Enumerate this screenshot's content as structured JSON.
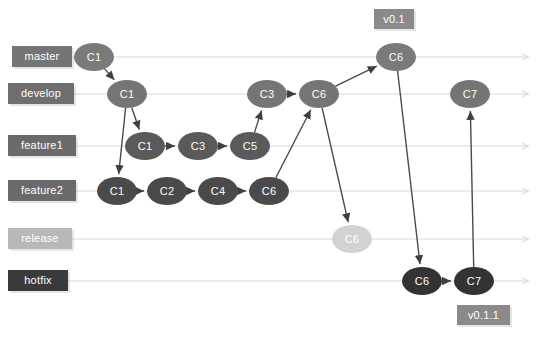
{
  "diagram": {
    "width": 537,
    "height": 339,
    "background": "#ffffff"
  },
  "colors": {
    "master_label": "#757575",
    "develop_label": "#6e6e6e",
    "feature1_label": "#6a6a6a",
    "feature2_label": "#6a6a6a",
    "release_label": "#b8b8b8",
    "hotfix_label": "#3a3a3a",
    "tag": "#8a8a8a",
    "node_master": "#7a7a7a",
    "node_develop": "#757575",
    "node_feature1": "#5a5a5a",
    "node_feature2": "#4a4a4a",
    "node_release": "#d2d2d2",
    "node_hotfix": "#333333",
    "lane_line": "#e6e6e6",
    "edge_line": "#4a4a4a"
  },
  "lanes": [
    {
      "id": "master",
      "label": "master",
      "y": 57,
      "label_x": 12,
      "label_w": 60,
      "color": "#757575",
      "line_x1": 70,
      "line_x2": 528
    },
    {
      "id": "develop",
      "label": "develop",
      "y": 94,
      "label_x": 8,
      "label_w": 66,
      "color": "#6e6e6e",
      "line_x1": 72,
      "line_x2": 528
    },
    {
      "id": "feature1",
      "label": "feature1",
      "y": 146,
      "label_x": 8,
      "label_w": 68,
      "color": "#6a6a6a",
      "line_x1": 74,
      "line_x2": 528
    },
    {
      "id": "feature2",
      "label": "feature2",
      "y": 191,
      "label_x": 8,
      "label_w": 68,
      "color": "#6a6a6a",
      "line_x1": 74,
      "line_x2": 528
    },
    {
      "id": "release",
      "label": "release",
      "y": 239,
      "label_x": 8,
      "label_w": 64,
      "color": "#b8b8b8",
      "line_x1": 72,
      "line_x2": 528
    },
    {
      "id": "hotfix",
      "label": "hotfix",
      "y": 281,
      "label_x": 8,
      "label_w": 60,
      "color": "#3a3a3a",
      "line_x1": 68,
      "line_x2": 528
    }
  ],
  "commits": [
    {
      "id": "m-c1",
      "label": "C1",
      "lane": "master",
      "x": 94,
      "y": 57,
      "color": "#7a7a7a"
    },
    {
      "id": "m-c6",
      "label": "C6",
      "lane": "master",
      "x": 396,
      "y": 57,
      "color": "#7a7a7a"
    },
    {
      "id": "d-c1",
      "label": "C1",
      "lane": "develop",
      "x": 127,
      "y": 94,
      "color": "#757575"
    },
    {
      "id": "d-c3",
      "label": "C3",
      "lane": "develop",
      "x": 267,
      "y": 94,
      "color": "#757575"
    },
    {
      "id": "d-c6",
      "label": "C6",
      "lane": "develop",
      "x": 319,
      "y": 94,
      "color": "#757575"
    },
    {
      "id": "d-c7",
      "label": "C7",
      "lane": "develop",
      "x": 470,
      "y": 94,
      "color": "#757575"
    },
    {
      "id": "f1-c1",
      "label": "C1",
      "lane": "feature1",
      "x": 145,
      "y": 146,
      "color": "#5a5a5a"
    },
    {
      "id": "f1-c3",
      "label": "C3",
      "lane": "feature1",
      "x": 198,
      "y": 146,
      "color": "#5a5a5a"
    },
    {
      "id": "f1-c5",
      "label": "C5",
      "lane": "feature1",
      "x": 250,
      "y": 146,
      "color": "#5a5a5a"
    },
    {
      "id": "f2-c1",
      "label": "C1",
      "lane": "feature2",
      "x": 117,
      "y": 191,
      "color": "#4a4a4a"
    },
    {
      "id": "f2-c2",
      "label": "C2",
      "lane": "feature2",
      "x": 167,
      "y": 191,
      "color": "#4a4a4a"
    },
    {
      "id": "f2-c4",
      "label": "C4",
      "lane": "feature2",
      "x": 218,
      "y": 191,
      "color": "#4a4a4a"
    },
    {
      "id": "f2-c6",
      "label": "C6",
      "lane": "feature2",
      "x": 269,
      "y": 191,
      "color": "#4a4a4a"
    },
    {
      "id": "r-c6",
      "label": "C6",
      "lane": "release",
      "x": 352,
      "y": 239,
      "color": "#d2d2d2"
    },
    {
      "id": "h-c6",
      "label": "C6",
      "lane": "hotfix",
      "x": 422,
      "y": 281,
      "color": "#333333"
    },
    {
      "id": "h-c7",
      "label": "C7",
      "lane": "hotfix",
      "x": 474,
      "y": 281,
      "color": "#333333"
    }
  ],
  "tags": [
    {
      "id": "tag-v01",
      "label": "v0.1",
      "x": 374,
      "y": 9,
      "w": 40,
      "color": "#8a8a8a"
    },
    {
      "id": "tag-v011",
      "label": "v0.1.1",
      "x": 457,
      "y": 305,
      "w": 53,
      "color": "#8a8a8a"
    }
  ],
  "edges": [
    {
      "from": "m-c1",
      "to": "d-c1"
    },
    {
      "from": "d-c1",
      "to": "f1-c1"
    },
    {
      "from": "d-c1",
      "to": "f2-c1"
    },
    {
      "from": "f1-c1",
      "to": "f1-c3"
    },
    {
      "from": "f1-c3",
      "to": "f1-c5"
    },
    {
      "from": "f1-c5",
      "to": "d-c3"
    },
    {
      "from": "f2-c1",
      "to": "f2-c2"
    },
    {
      "from": "f2-c2",
      "to": "f2-c4"
    },
    {
      "from": "f2-c4",
      "to": "f2-c6"
    },
    {
      "from": "f2-c6",
      "to": "d-c6"
    },
    {
      "from": "d-c3",
      "to": "d-c6"
    },
    {
      "from": "d-c6",
      "to": "m-c6"
    },
    {
      "from": "d-c6",
      "to": "r-c6"
    },
    {
      "from": "m-c6",
      "to": "h-c6"
    },
    {
      "from": "h-c6",
      "to": "h-c7"
    },
    {
      "from": "h-c7",
      "to": "d-c7"
    }
  ]
}
